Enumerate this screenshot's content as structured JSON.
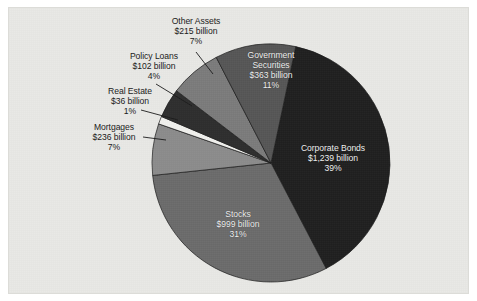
{
  "figure": {
    "background_color": "#e9e9e6",
    "border_color": "#dcdcd8"
  },
  "chart_data": {
    "type": "pie",
    "title": "",
    "subtitle": "",
    "xlabel": "",
    "ylabel": "",
    "legend_position": "none",
    "grid": false,
    "units": "billions of dollars",
    "total_label": "",
    "categories": [
      "Corporate Bonds",
      "Stocks",
      "Mortgages",
      "Real Estate",
      "Policy Loans",
      "Other Assets",
      "Government Securities"
    ],
    "values": [
      1239,
      999,
      236,
      36,
      102,
      215,
      363
    ],
    "percents": [
      39,
      31,
      7,
      1,
      4,
      7,
      11
    ],
    "value_labels": [
      "$1,239 billion",
      "$999 billion",
      "$236 billion",
      "$36 billion",
      "$102 billion",
      "$215 billion",
      "$363 billion"
    ],
    "percent_labels": [
      "39%",
      "31%",
      "7%",
      "1%",
      "4%",
      "7%",
      "11%"
    ],
    "colors": [
      "#1f1f1f",
      "#6b6b6b",
      "#8c8c8c",
      "#f1f1ee",
      "#2e2e2e",
      "#7b7b7b",
      "#565656"
    ],
    "slices": [
      {
        "name": "Corporate Bonds",
        "value": 1239,
        "value_label": "$1,239 billion",
        "percent": 39,
        "percent_label": "39%",
        "color": "#1f1f1f",
        "start_angle": 12,
        "end_angle": 152.4,
        "label_placement": "inside"
      },
      {
        "name": "Stocks",
        "value": 999,
        "value_label": "$999 billion",
        "percent": 31,
        "percent_label": "31%",
        "color": "#6b6b6b",
        "start_angle": 152.4,
        "end_angle": 264.0,
        "label_placement": "inside"
      },
      {
        "name": "Mortgages",
        "value": 236,
        "value_label": "$236 billion",
        "percent": 7,
        "percent_label": "7%",
        "color": "#8c8c8c",
        "start_angle": 264.0,
        "end_angle": 289.2,
        "label_placement": "outside"
      },
      {
        "name": "Real Estate",
        "value": 36,
        "value_label": "$36 billion",
        "percent": 1,
        "percent_label": "1%",
        "color": "#f1f1ee",
        "start_angle": 289.2,
        "end_angle": 293.0,
        "label_placement": "outside"
      },
      {
        "name": "Policy Loans",
        "value": 102,
        "value_label": "$102 billion",
        "percent": 4,
        "percent_label": "4%",
        "color": "#2e2e2e",
        "start_angle": 293.0,
        "end_angle": 307.4,
        "label_placement": "outside"
      },
      {
        "name": "Other Assets",
        "value": 215,
        "value_label": "$215 billion",
        "percent": 7,
        "percent_label": "7%",
        "color": "#7b7b7b",
        "start_angle": 307.4,
        "end_angle": 332.6,
        "label_placement": "outside"
      },
      {
        "name": "Government Securities",
        "value": 363,
        "value_label": "$363 billion",
        "percent": 11,
        "percent_label": "11%",
        "color": "#565656",
        "start_angle": 332.6,
        "end_angle": 372,
        "label_placement": "inside"
      }
    ]
  },
  "labels": {
    "other_assets": {
      "name": "Other Assets",
      "value": "$215 billion",
      "percent": "7%"
    },
    "policy_loans": {
      "name": "Policy Loans",
      "value": "$102 billion",
      "percent": "4%"
    },
    "real_estate": {
      "name": "Real Estate",
      "value": "$36 billion",
      "percent": "1%"
    },
    "mortgages": {
      "name": "Mortgages",
      "value": "$236 billion",
      "percent": "7%"
    },
    "government_securities": {
      "name_line1": "Government",
      "name_line2": "Securities",
      "value": "$363 billion",
      "percent": "11%"
    },
    "corporate_bonds": {
      "name": "Corporate Bonds",
      "value": "$1,239 billion",
      "percent": "39%"
    },
    "stocks": {
      "name": "Stocks",
      "value": "$999 billion",
      "percent": "31%"
    }
  }
}
